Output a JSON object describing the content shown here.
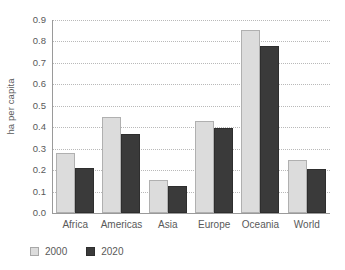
{
  "chart_data": {
    "type": "bar",
    "title": "",
    "xlabel": "",
    "ylabel": "ha per capita",
    "ylim": [
      0.0,
      0.9
    ],
    "yticks": [
      "0.0",
      "0.1",
      "0.2",
      "0.3",
      "0.4",
      "0.5",
      "0.6",
      "0.7",
      "0.8",
      "0.9"
    ],
    "grid": true,
    "legend_position": "bottom-left",
    "categories": [
      "Africa",
      "Americas",
      "Asia",
      "Europe",
      "Oceania",
      "World"
    ],
    "series": [
      {
        "name": "2000",
        "color": "#dcdcdc",
        "values": [
          0.28,
          0.45,
          0.155,
          0.43,
          0.855,
          0.245
        ]
      },
      {
        "name": "2020",
        "color": "#3a3a3a",
        "values": [
          0.21,
          0.37,
          0.125,
          0.395,
          0.78,
          0.205
        ]
      }
    ]
  }
}
